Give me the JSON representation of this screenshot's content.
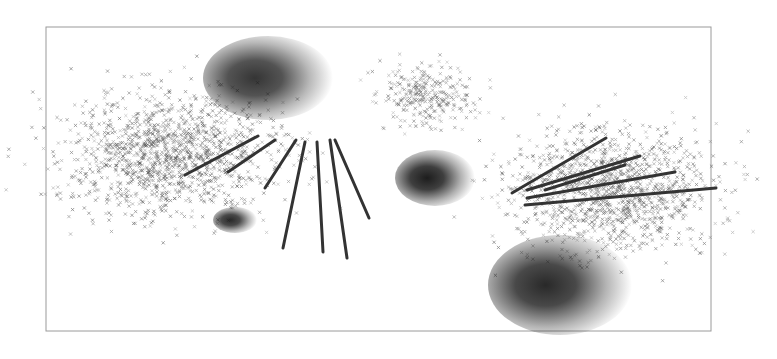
{
  "figure": {
    "frame": {
      "x": 46,
      "y": 27,
      "width": 312,
      "height": 126,
      "stroke": "#999999"
    },
    "scatter_clouds": [
      {
        "name": "left-cloud",
        "cx": 170,
        "cy": 155,
        "rx": 95,
        "ry": 55,
        "count": 1400,
        "color": "#555555"
      },
      {
        "name": "top-middle-cloud",
        "cx": 425,
        "cy": 95,
        "rx": 45,
        "ry": 28,
        "count": 320,
        "color": "#666666"
      },
      {
        "name": "right-cloud",
        "cx": 610,
        "cy": 190,
        "rx": 95,
        "ry": 55,
        "count": 1300,
        "color": "#555555"
      }
    ],
    "gaussian_blobs": [
      {
        "name": "top-blob",
        "cx": 268,
        "cy": 78,
        "rx": 65,
        "ry": 42,
        "darkness": 0.85
      },
      {
        "name": "small-left-blob",
        "cx": 235,
        "cy": 220,
        "rx": 22,
        "ry": 13,
        "darkness": 0.9
      },
      {
        "name": "center-blob",
        "cx": 435,
        "cy": 178,
        "rx": 40,
        "ry": 28,
        "darkness": 0.95
      },
      {
        "name": "bottom-right-blob",
        "cx": 560,
        "cy": 285,
        "rx": 72,
        "ry": 50,
        "darkness": 0.9
      }
    ],
    "line_segments": [
      {
        "x1": 185,
        "y1": 175,
        "x2": 258,
        "y2": 136
      },
      {
        "x1": 228,
        "y1": 172,
        "x2": 275,
        "y2": 140
      },
      {
        "x1": 265,
        "y1": 188,
        "x2": 296,
        "y2": 140
      },
      {
        "x1": 283,
        "y1": 248,
        "x2": 305,
        "y2": 142
      },
      {
        "x1": 323,
        "y1": 252,
        "x2": 317,
        "y2": 142
      },
      {
        "x1": 347,
        "y1": 258,
        "x2": 330,
        "y2": 140
      },
      {
        "x1": 369,
        "y1": 218,
        "x2": 335,
        "y2": 140
      },
      {
        "x1": 512,
        "y1": 193,
        "x2": 606,
        "y2": 138
      },
      {
        "x1": 527,
        "y1": 190,
        "x2": 640,
        "y2": 156
      },
      {
        "x1": 527,
        "y1": 198,
        "x2": 675,
        "y2": 172
      },
      {
        "x1": 525,
        "y1": 205,
        "x2": 716,
        "y2": 188
      },
      {
        "x1": 545,
        "y1": 190,
        "x2": 625,
        "y2": 165
      }
    ]
  }
}
